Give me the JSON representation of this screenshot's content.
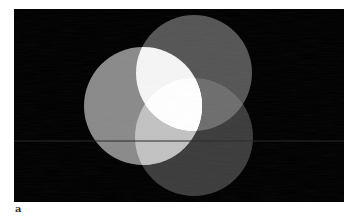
{
  "figure": {
    "panel_label": "a",
    "background_color": "#000000",
    "frame": {
      "x": 14,
      "y": 9,
      "width": 330,
      "height": 193
    },
    "circles": [
      {
        "name": "left",
        "cx": 143,
        "cy": 106,
        "r": 59,
        "color": "#8a8a8a"
      },
      {
        "name": "top",
        "cx": 194,
        "cy": 73,
        "r": 58,
        "color": "#555555"
      },
      {
        "name": "bottom",
        "cx": 194,
        "cy": 137,
        "r": 59,
        "color": "#3c3c3c"
      }
    ],
    "overlap_colors": {
      "left_top": "#f5f5f5",
      "left_bottom": "#c2c2c2",
      "top_bottom": "#6e6e6e",
      "all": "#ffffff"
    },
    "scan_line_y": 141
  }
}
